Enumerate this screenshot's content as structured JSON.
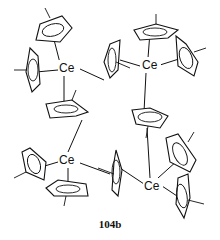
{
  "diagram": {
    "type": "chemical-structure",
    "compound_label": "104b",
    "metal_centers": [
      {
        "id": "ce1",
        "label": "Ce",
        "position": "top-left"
      },
      {
        "id": "ce2",
        "label": "Ce",
        "position": "top-right"
      },
      {
        "id": "ce3",
        "label": "Ce",
        "position": "bottom-left"
      },
      {
        "id": "ce4",
        "label": "Ce",
        "position": "bottom-right"
      }
    ],
    "ligands": "methylcyclopentadienyl (C5H4Me) rings, terminal and bridging",
    "colors": {
      "ink": "#111111",
      "background": "#ffffff"
    }
  }
}
